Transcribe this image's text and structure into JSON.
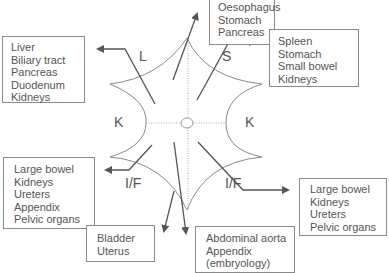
{
  "diagram": {
    "regions": {
      "upper_left": "L",
      "upper_right": "S",
      "left": "K",
      "right": "K",
      "lower_left": "I/F",
      "lower_right": "I/F"
    },
    "boxes": {
      "top_center": [
        "Oesophagus",
        "Stomach",
        "Pancreas"
      ],
      "upper_left": [
        "Liver",
        "Biliary tract",
        "Pancreas",
        "Duodenum",
        "Kidneys"
      ],
      "upper_right": [
        "Spleen",
        "Stomach",
        "Small bowel",
        "Kidneys"
      ],
      "lower_left": [
        "Large bowel",
        "Kidneys",
        "Ureters",
        "Appendix",
        "Pelvic organs"
      ],
      "lower_right": [
        "Large bowel",
        "Kidneys",
        "Ureters",
        "Pelvic organs"
      ],
      "bottom_left": [
        "Bladder",
        "Uterus"
      ],
      "bottom_center": [
        "Abdominal aorta",
        "Appendix",
        "(embryology)"
      ]
    },
    "colors": {
      "line": "#555555",
      "curve": "#8a8a8a",
      "grid": "#aaaaaa"
    }
  }
}
